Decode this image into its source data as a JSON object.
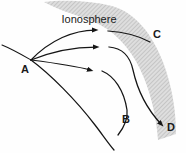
{
  "figure": {
    "background_color": "#fefefe",
    "stroke_color": "#151515",
    "band_fill_color": "#d9d9d9",
    "band_hatch_color": "#b8b8b8"
  },
  "band": {
    "label": "Ionosphere",
    "label_x": 63,
    "label_y": 19,
    "description": "Shaded hatched layer sweeping from upper-left to lower-right"
  },
  "points": [
    {
      "id": "A",
      "label": "A",
      "x": 31,
      "y": 60,
      "role": "transmitter-origin"
    },
    {
      "id": "B",
      "label": "B",
      "x": 126,
      "y": 119,
      "role": "reflected-ray-label"
    },
    {
      "id": "C",
      "label": "C",
      "x": 156,
      "y": 34,
      "role": "escaping-ray-label"
    },
    {
      "id": "D",
      "label": "D",
      "x": 170,
      "y": 127,
      "role": "refracted-ray-label"
    }
  ],
  "rays": [
    {
      "id": "ray-c",
      "label": "C",
      "behavior": "passes-through-ionosphere",
      "arrow_at": {
        "x": 107,
        "y": 31
      }
    },
    {
      "id": "ray-d",
      "label": "D",
      "behavior": "refracted-down-through-layer",
      "arrow_at": {
        "x": 107,
        "y": 48
      }
    },
    {
      "id": "ray-b",
      "label": "B",
      "behavior": "returned-to-earth",
      "arrow_at": {
        "x": 100,
        "y": 70
      }
    }
  ],
  "surface": {
    "id": "earth-surface",
    "description": "Curved earth surface line passing through point A"
  }
}
